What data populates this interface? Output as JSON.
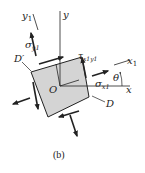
{
  "figure": {
    "caption": "(b)",
    "colors": {
      "element_fill": "#d4d4d4",
      "stroke": "#222222",
      "background": "#ffffff"
    },
    "labels": {
      "y_axis": "y",
      "x_axis": "x",
      "y1_axis": "y",
      "y1_sub": "1",
      "x1_axis": "x",
      "x1_sub": "1",
      "origin": "O",
      "theta": "θ",
      "sigma_y1": "σ",
      "sigma_y1_sub": "y1",
      "sigma_x1": "σ",
      "sigma_x1_sub": "x1",
      "tau": "τ",
      "tau_sub": "x1y1",
      "point_D": "D",
      "point_D_prime": "D′"
    }
  }
}
